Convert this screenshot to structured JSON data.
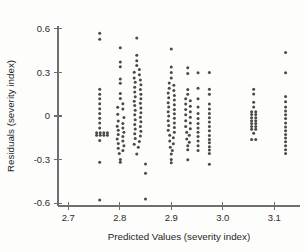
{
  "chart_data": {
    "type": "scatter",
    "title": "",
    "xlabel": "Predicted Values (severity index)",
    "ylabel": "Residuals (severity index)",
    "xlim": [
      2.68,
      3.15
    ],
    "ylim": [
      -0.62,
      0.62
    ],
    "xticks": [
      2.7,
      2.8,
      2.9,
      3.0,
      3.1
    ],
    "xtick_labels": [
      "2.7",
      "2.8",
      "2.9",
      "3.0",
      "3.1"
    ],
    "yticks": [
      0.6,
      0.3,
      0.0,
      -0.3,
      -0.6
    ],
    "ytick_labels": [
      "0.6",
      "0.3",
      "0",
      "-0.3",
      "-0.6"
    ],
    "grid": false,
    "legend": null,
    "marker_color": "#4a4a4a",
    "marker_size_px": 3.0,
    "axis_color": "#6f6f6f",
    "background_color": "#fdfdfc",
    "n_points": 214,
    "points": [
      [
        2.761,
        0.57
      ],
      [
        2.761,
        0.528
      ],
      [
        2.761,
        0.185
      ],
      [
        2.761,
        0.15
      ],
      [
        2.761,
        0.118
      ],
      [
        2.761,
        0.085
      ],
      [
        2.761,
        0.05
      ],
      [
        2.761,
        0.018
      ],
      [
        2.761,
        -0.015
      ],
      [
        2.761,
        -0.048
      ],
      [
        2.761,
        -0.082
      ],
      [
        2.755,
        -0.115
      ],
      [
        2.762,
        -0.115
      ],
      [
        2.769,
        -0.115
      ],
      [
        2.776,
        -0.115
      ],
      [
        2.755,
        -0.132
      ],
      [
        2.762,
        -0.132
      ],
      [
        2.769,
        -0.132
      ],
      [
        2.776,
        -0.132
      ],
      [
        2.761,
        -0.168
      ],
      [
        2.761,
        -0.318
      ],
      [
        2.761,
        -0.578
      ],
      [
        2.801,
        0.47
      ],
      [
        2.801,
        0.372
      ],
      [
        2.801,
        0.34
      ],
      [
        2.801,
        0.255
      ],
      [
        2.801,
        0.225
      ],
      [
        2.801,
        0.155
      ],
      [
        2.801,
        0.12
      ],
      [
        2.806,
        0.085
      ],
      [
        2.796,
        0.06
      ],
      [
        2.806,
        0.048
      ],
      [
        2.796,
        0.012
      ],
      [
        2.808,
        -0.01
      ],
      [
        2.797,
        -0.035
      ],
      [
        2.806,
        -0.052
      ],
      [
        2.795,
        -0.07
      ],
      [
        2.806,
        -0.082
      ],
      [
        2.797,
        -0.098
      ],
      [
        2.808,
        -0.112
      ],
      [
        2.797,
        -0.128
      ],
      [
        2.806,
        -0.142
      ],
      [
        2.795,
        -0.158
      ],
      [
        2.806,
        -0.172
      ],
      [
        2.797,
        -0.19
      ],
      [
        2.808,
        -0.205
      ],
      [
        2.797,
        -0.222
      ],
      [
        2.806,
        -0.238
      ],
      [
        2.799,
        -0.258
      ],
      [
        2.801,
        -0.3
      ],
      [
        2.801,
        -0.318
      ],
      [
        2.833,
        0.538
      ],
      [
        2.833,
        0.418
      ],
      [
        2.833,
        0.38
      ],
      [
        2.833,
        0.348
      ],
      [
        2.838,
        0.32
      ],
      [
        2.828,
        0.302
      ],
      [
        2.838,
        0.285
      ],
      [
        2.828,
        0.262
      ],
      [
        2.84,
        0.248
      ],
      [
        2.83,
        0.232
      ],
      [
        2.841,
        0.215
      ],
      [
        2.829,
        0.198
      ],
      [
        2.84,
        0.182
      ],
      [
        2.829,
        0.165
      ],
      [
        2.841,
        0.15
      ],
      [
        2.83,
        0.132
      ],
      [
        2.841,
        0.118
      ],
      [
        2.828,
        0.102
      ],
      [
        2.84,
        0.088
      ],
      [
        2.829,
        0.072
      ],
      [
        2.841,
        0.055
      ],
      [
        2.83,
        0.04
      ],
      [
        2.841,
        0.022
      ],
      [
        2.829,
        0.008
      ],
      [
        2.84,
        -0.008
      ],
      [
        2.83,
        -0.025
      ],
      [
        2.841,
        -0.04
      ],
      [
        2.829,
        -0.058
      ],
      [
        2.84,
        -0.072
      ],
      [
        2.83,
        -0.09
      ],
      [
        2.841,
        -0.105
      ],
      [
        2.829,
        -0.122
      ],
      [
        2.84,
        -0.138
      ],
      [
        2.83,
        -0.155
      ],
      [
        2.838,
        -0.175
      ],
      [
        2.828,
        -0.195
      ],
      [
        2.836,
        -0.215
      ],
      [
        2.833,
        -0.262
      ],
      [
        2.85,
        -0.33
      ],
      [
        2.85,
        -0.395
      ],
      [
        2.85,
        -0.572
      ],
      [
        2.9,
        0.462
      ],
      [
        2.9,
        0.338
      ],
      [
        2.9,
        0.3
      ],
      [
        2.9,
        0.262
      ],
      [
        2.896,
        0.228
      ],
      [
        2.905,
        0.212
      ],
      [
        2.896,
        0.192
      ],
      [
        2.905,
        0.175
      ],
      [
        2.894,
        0.158
      ],
      [
        2.906,
        0.142
      ],
      [
        2.895,
        0.125
      ],
      [
        2.906,
        0.11
      ],
      [
        2.894,
        0.092
      ],
      [
        2.906,
        0.078
      ],
      [
        2.895,
        0.062
      ],
      [
        2.906,
        0.045
      ],
      [
        2.894,
        0.03
      ],
      [
        2.906,
        0.015
      ],
      [
        2.895,
        0.0
      ],
      [
        2.906,
        -0.015
      ],
      [
        2.894,
        -0.032
      ],
      [
        2.906,
        -0.048
      ],
      [
        2.895,
        -0.065
      ],
      [
        2.906,
        -0.08
      ],
      [
        2.894,
        -0.098
      ],
      [
        2.906,
        -0.112
      ],
      [
        2.897,
        -0.132
      ],
      [
        2.904,
        -0.15
      ],
      [
        2.897,
        -0.172
      ],
      [
        2.904,
        -0.192
      ],
      [
        2.898,
        -0.215
      ],
      [
        2.902,
        -0.238
      ],
      [
        2.9,
        -0.262
      ],
      [
        2.9,
        -0.3
      ],
      [
        2.9,
        -0.322
      ],
      [
        2.932,
        0.332
      ],
      [
        2.932,
        0.292
      ],
      [
        2.932,
        0.182
      ],
      [
        2.932,
        0.15
      ],
      [
        2.928,
        0.118
      ],
      [
        2.937,
        0.105
      ],
      [
        2.928,
        0.082
      ],
      [
        2.937,
        0.068
      ],
      [
        2.928,
        0.045
      ],
      [
        2.937,
        0.03
      ],
      [
        2.928,
        0.008
      ],
      [
        2.937,
        -0.008
      ],
      [
        2.928,
        -0.032
      ],
      [
        2.937,
        -0.048
      ],
      [
        2.928,
        -0.072
      ],
      [
        2.937,
        -0.088
      ],
      [
        2.93,
        -0.112
      ],
      [
        2.935,
        -0.132
      ],
      [
        2.93,
        -0.158
      ],
      [
        2.935,
        -0.18
      ],
      [
        2.932,
        -0.205
      ],
      [
        2.932,
        -0.232
      ],
      [
        2.932,
        -0.302
      ],
      [
        2.952,
        0.298
      ],
      [
        2.952,
        0.192
      ],
      [
        2.952,
        0.118
      ],
      [
        2.952,
        0.062
      ],
      [
        2.952,
        0.018
      ],
      [
        2.952,
        -0.018
      ],
      [
        2.952,
        -0.052
      ],
      [
        2.952,
        -0.082
      ],
      [
        2.952,
        -0.112
      ],
      [
        2.952,
        -0.142
      ],
      [
        2.952,
        -0.172
      ],
      [
        2.952,
        -0.205
      ],
      [
        2.952,
        -0.238
      ],
      [
        2.974,
        0.3
      ],
      [
        2.974,
        0.185
      ],
      [
        2.974,
        0.15
      ],
      [
        2.974,
        0.082
      ],
      [
        2.974,
        0.048
      ],
      [
        2.974,
        0.018
      ],
      [
        2.974,
        -0.012
      ],
      [
        2.974,
        -0.042
      ],
      [
        2.974,
        -0.072
      ],
      [
        2.974,
        -0.102
      ],
      [
        2.974,
        -0.135
      ],
      [
        2.974,
        -0.162
      ],
      [
        2.974,
        -0.185
      ],
      [
        2.974,
        -0.212
      ],
      [
        2.974,
        -0.235
      ],
      [
        2.974,
        -0.258
      ],
      [
        2.974,
        -0.332
      ],
      [
        3.06,
        0.185
      ],
      [
        3.06,
        0.152
      ],
      [
        3.06,
        0.095
      ],
      [
        3.06,
        0.062
      ],
      [
        3.056,
        0.03
      ],
      [
        3.064,
        0.03
      ],
      [
        3.056,
        0.01
      ],
      [
        3.064,
        0.01
      ],
      [
        3.056,
        -0.012
      ],
      [
        3.064,
        -0.012
      ],
      [
        3.056,
        -0.032
      ],
      [
        3.064,
        -0.032
      ],
      [
        3.056,
        -0.052
      ],
      [
        3.064,
        -0.052
      ],
      [
        3.056,
        -0.072
      ],
      [
        3.064,
        -0.072
      ],
      [
        3.056,
        -0.092
      ],
      [
        3.064,
        -0.092
      ],
      [
        3.06,
        -0.118
      ],
      [
        3.056,
        -0.162
      ],
      [
        3.064,
        -0.162
      ],
      [
        3.122,
        0.438
      ],
      [
        3.122,
        0.298
      ],
      [
        3.122,
        0.135
      ],
      [
        3.122,
        0.098
      ],
      [
        3.122,
        0.062
      ],
      [
        3.122,
        0.035
      ],
      [
        3.122,
        0.008
      ],
      [
        3.122,
        -0.018
      ],
      [
        3.122,
        -0.048
      ],
      [
        3.122,
        -0.075
      ],
      [
        3.122,
        -0.102
      ],
      [
        3.122,
        -0.128
      ],
      [
        3.122,
        -0.152
      ],
      [
        3.122,
        -0.178
      ],
      [
        3.122,
        -0.205
      ],
      [
        3.122,
        -0.232
      ],
      [
        3.122,
        -0.258
      ]
    ]
  }
}
